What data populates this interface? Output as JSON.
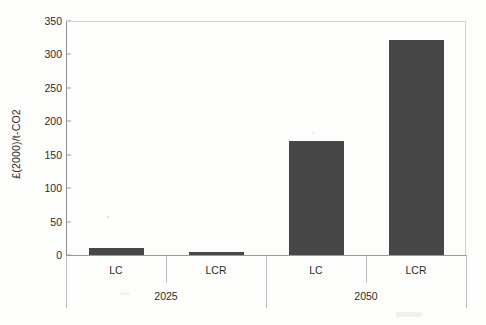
{
  "chart_data": {
    "type": "bar",
    "title": "",
    "xlabel": "",
    "ylabel": "£(2000)/t-CO2",
    "ylim": [
      0,
      350
    ],
    "yticks": [
      0,
      50,
      100,
      150,
      200,
      250,
      300,
      350
    ],
    "ytick_labels": [
      "0",
      "50",
      "100",
      "150",
      "200",
      "250",
      "300",
      "350"
    ],
    "grid": false,
    "legend": "none",
    "bar_color": "#474747",
    "categories": [
      "LC",
      "LCR",
      "LC",
      "LCR"
    ],
    "groups": [
      {
        "label": "2025",
        "categories": [
          "LC",
          "LCR"
        ]
      },
      {
        "label": "2050",
        "categories": [
          "LC",
          "LCR"
        ]
      }
    ],
    "values": [
      10,
      5,
      170,
      322
    ],
    "bars": [
      {
        "group": "2025",
        "category": "LC",
        "value": 10
      },
      {
        "group": "2025",
        "category": "LCR",
        "value": 5
      },
      {
        "group": "2050",
        "category": "LC",
        "value": 170
      },
      {
        "group": "2050",
        "category": "LCR",
        "value": 322
      }
    ]
  }
}
